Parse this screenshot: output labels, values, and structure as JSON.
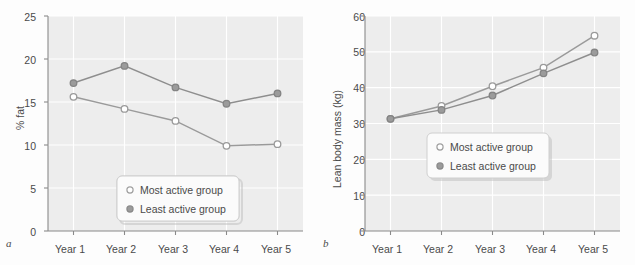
{
  "figure": {
    "panels": [
      {
        "letter": "a",
        "chart_data": {
          "type": "line",
          "title": "",
          "xlabel": "",
          "ylabel": "% fat",
          "categories": [
            "Year 1",
            "Year 2",
            "Year 3",
            "Year 4",
            "Year 5"
          ],
          "ylim": [
            0,
            25
          ],
          "yticks": [
            0,
            5,
            10,
            15,
            20,
            25
          ],
          "grid": true,
          "legend_position": "lower-center",
          "series": [
            {
              "name": "Most active group",
              "marker": "open-circle",
              "values": [
                15.6,
                14.2,
                12.8,
                9.9,
                10.1
              ]
            },
            {
              "name": "Least active group",
              "marker": "filled-circle",
              "values": [
                17.2,
                19.2,
                16.7,
                14.8,
                16.0
              ]
            }
          ]
        }
      },
      {
        "letter": "b",
        "chart_data": {
          "type": "line",
          "title": "",
          "xlabel": "",
          "ylabel": "Lean body mass (kg)",
          "categories": [
            "Year 1",
            "Year 2",
            "Year 3",
            "Year 4",
            "Year 5"
          ],
          "ylim": [
            0,
            60
          ],
          "yticks": [
            0,
            10,
            20,
            30,
            40,
            50,
            60
          ],
          "grid": true,
          "legend_position": "center",
          "series": [
            {
              "name": "Most active group",
              "marker": "open-circle",
              "values": [
                31.3,
                34.9,
                40.4,
                45.6,
                54.5
              ]
            },
            {
              "name": "Least active group",
              "marker": "filled-circle",
              "values": [
                31.3,
                33.8,
                37.8,
                44.0,
                49.8
              ]
            }
          ]
        }
      }
    ],
    "colors": {
      "line_most_active": "#9a9a9a",
      "line_least_active": "#8e8e8e",
      "marker_open_fill": "#ffffff",
      "marker_filled": "#9b9b9b",
      "plot_background": "#ededed",
      "gridline": "#ffffff",
      "axis": "#8a8a8a",
      "text": "#4a4a4a"
    }
  }
}
